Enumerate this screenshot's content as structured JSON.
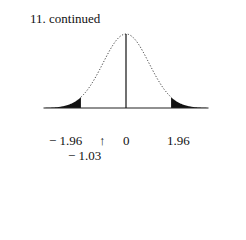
{
  "title": "11. continued",
  "chart_data": {
    "type": "area",
    "title": "11. continued",
    "distribution": "standard normal",
    "xlabel": "",
    "ylabel": "",
    "xlim": [
      -3.5,
      3.5
    ],
    "grid": false,
    "legend": null,
    "shaded_regions": [
      {
        "from": -3.5,
        "to": -1.96,
        "fill": "#111111"
      },
      {
        "from": 1.96,
        "to": 3.5,
        "fill": "#111111"
      }
    ],
    "center_line": 0,
    "tick_labels": [
      "− 1.96",
      "0",
      "1.96"
    ],
    "tick_values": [
      -1.96,
      0,
      1.96
    ],
    "annotations": [
      {
        "text": "↑",
        "x": -1.03
      },
      {
        "text": "− 1.03",
        "x": -1.03
      }
    ]
  },
  "labels": {
    "neg_crit": "− 1.96",
    "arrow": "↑",
    "zero": "0",
    "pos_crit": "1.96",
    "observed": "− 1.03"
  }
}
